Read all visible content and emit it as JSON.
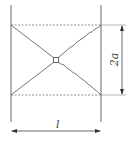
{
  "diagram": {
    "type": "engineering-dimension-drawing",
    "labels": {
      "height_dimension": "2a",
      "width_dimension": "l"
    },
    "colors": {
      "line": "#555555",
      "background": "#ffffff"
    }
  }
}
